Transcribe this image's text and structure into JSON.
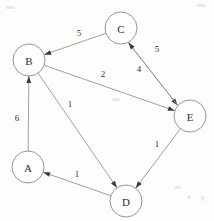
{
  "diagram": {
    "type": "directed-weighted-graph",
    "background_color": "#fdfdfc",
    "node_stroke_color": "#8a8a8a",
    "edge_color": "#8f8f8f",
    "label_color": "#2b2b2b",
    "node_radius": 16,
    "nodes": [
      {
        "id": "A",
        "label": "A",
        "x": 28,
        "y": 167
      },
      {
        "id": "B",
        "label": "B",
        "x": 29,
        "y": 60
      },
      {
        "id": "C",
        "label": "C",
        "x": 121,
        "y": 28
      },
      {
        "id": "D",
        "label": "D",
        "x": 126,
        "y": 201
      },
      {
        "id": "E",
        "label": "E",
        "x": 190,
        "y": 116
      }
    ],
    "edges": [
      {
        "from": "C",
        "to": "B",
        "weight": "5",
        "label_x": 79,
        "label_y": 33
      },
      {
        "from": "C",
        "to": "E",
        "weight": "5",
        "label_x": 157,
        "label_y": 49
      },
      {
        "from": "E",
        "to": "C",
        "weight": "4",
        "label_x": 139,
        "label_y": 69
      },
      {
        "from": "B",
        "to": "E",
        "weight": "2",
        "label_x": 103,
        "label_y": 74
      },
      {
        "from": "B",
        "to": "D",
        "weight": "1",
        "label_x": 70,
        "label_y": 104
      },
      {
        "from": "A",
        "to": "B",
        "weight": "6",
        "label_x": 17,
        "label_y": 118
      },
      {
        "from": "D",
        "to": "A",
        "weight": "1",
        "label_x": 77,
        "label_y": 174
      },
      {
        "from": "E",
        "to": "D",
        "weight": "1",
        "label_x": 157,
        "label_y": 144
      }
    ]
  }
}
